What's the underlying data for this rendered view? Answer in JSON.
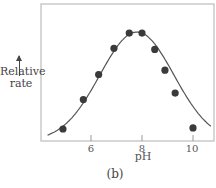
{
  "chart_data": {
    "type": "scatter",
    "title": "",
    "caption": "(b)",
    "xlabel": "pH",
    "ylabel": "Relative rate",
    "ylabel_lines": [
      "Relative",
      "rate"
    ],
    "xlim": [
      4.0,
      10.9
    ],
    "ylim": [
      0,
      1.1
    ],
    "xticks": [
      6,
      8,
      10
    ],
    "xtick_labels": [
      "6",
      "8",
      "10"
    ],
    "yticks": [],
    "grid": false,
    "legend": null,
    "series": [
      {
        "name": "measured",
        "type": "scatter",
        "x": [
          4.9,
          5.7,
          6.3,
          6.9,
          7.5,
          8.0,
          8.5,
          8.9,
          9.3,
          10.0
        ],
        "y": [
          0.11,
          0.38,
          0.61,
          0.85,
          0.99,
          0.99,
          0.84,
          0.65,
          0.44,
          0.12
        ],
        "marker": "filled-circle",
        "color": "#3a3a3a"
      },
      {
        "name": "fitted bell curve",
        "type": "line",
        "description": "smooth bell-shaped curve peaking near pH 7.8",
        "peak_x": 7.8,
        "color": "#555555"
      }
    ]
  },
  "labels": {
    "ylabel_line1": "Relative",
    "ylabel_line2": "rate",
    "xlabel": "pH",
    "caption": "(b)",
    "tick_6": "6",
    "tick_8": "8",
    "tick_10": "10"
  }
}
